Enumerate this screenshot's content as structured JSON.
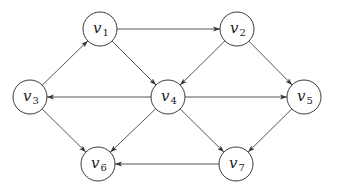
{
  "diagram": {
    "type": "directed-graph",
    "node_radius": 17,
    "colors": {
      "stroke": "#3a3a3a",
      "fill": "#ffffff",
      "edge": "#444444"
    },
    "nodes": [
      {
        "id": "v1",
        "letter": "v",
        "sub": "1",
        "x": 100,
        "y": 29
      },
      {
        "id": "v2",
        "letter": "v",
        "sub": "2",
        "x": 237,
        "y": 29
      },
      {
        "id": "v3",
        "letter": "v",
        "sub": "3",
        "x": 30,
        "y": 97
      },
      {
        "id": "v4",
        "letter": "v",
        "sub": "4",
        "x": 168,
        "y": 97
      },
      {
        "id": "v5",
        "letter": "v",
        "sub": "5",
        "x": 304,
        "y": 97
      },
      {
        "id": "v6",
        "letter": "v",
        "sub": "6",
        "x": 98,
        "y": 164
      },
      {
        "id": "v7",
        "letter": "v",
        "sub": "7",
        "x": 236,
        "y": 164
      }
    ],
    "edges": [
      {
        "from": "v3",
        "to": "v1"
      },
      {
        "from": "v1",
        "to": "v2"
      },
      {
        "from": "v1",
        "to": "v4"
      },
      {
        "from": "v2",
        "to": "v4"
      },
      {
        "from": "v2",
        "to": "v5"
      },
      {
        "from": "v4",
        "to": "v3"
      },
      {
        "from": "v4",
        "to": "v5"
      },
      {
        "from": "v3",
        "to": "v6"
      },
      {
        "from": "v4",
        "to": "v6"
      },
      {
        "from": "v4",
        "to": "v7"
      },
      {
        "from": "v5",
        "to": "v7"
      },
      {
        "from": "v7",
        "to": "v6"
      }
    ]
  }
}
